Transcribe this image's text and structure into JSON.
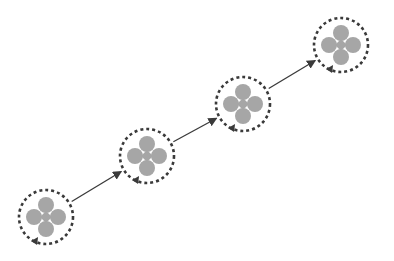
{
  "diagram": {
    "title": "",
    "colors": {
      "background": "#ffffff",
      "dashed_ring": "#3a3a3a",
      "petal": "#a6a6a6",
      "core": "#a6a6a6",
      "connector": "#3a3a3a"
    },
    "nodes": [
      {
        "id": "node-1",
        "cx": 46,
        "cy": 217,
        "ring_r": 27
      },
      {
        "id": "node-2",
        "cx": 147,
        "cy": 156,
        "ring_r": 27
      },
      {
        "id": "node-3",
        "cx": 243,
        "cy": 104,
        "ring_r": 27
      },
      {
        "id": "node-4",
        "cx": 341,
        "cy": 45,
        "ring_r": 27
      }
    ],
    "edges": [
      {
        "from": "node-1",
        "to": "node-2"
      },
      {
        "from": "node-2",
        "to": "node-3"
      },
      {
        "from": "node-3",
        "to": "node-4"
      }
    ],
    "node_shape": {
      "petal_r": 8,
      "petal_offset": 12,
      "core_half": 6,
      "ring_dash": "3 3",
      "ring_width": 2.6,
      "ring_arrow": "counter-clockwise arrowhead at lower-left of ring"
    }
  }
}
